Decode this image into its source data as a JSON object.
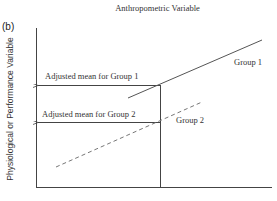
{
  "figure": {
    "panel_label": "(b)",
    "x_axis_title": "Anthropometric Variable",
    "y_axis_title": "Physiological or Performance Variable",
    "annotations": {
      "adjusted_mean_group1": "Adjusted mean for Group 1",
      "adjusted_mean_group2": "Adjusted mean for Group 2"
    },
    "series": [
      {
        "name": "Group 1",
        "style": "solid",
        "color": "#555555"
      },
      {
        "name": "Group 2",
        "style": "dashed",
        "color": "#777777"
      }
    ],
    "colors": {
      "axis": "#444444",
      "text": "#333333",
      "background": "#ffffff"
    }
  }
}
